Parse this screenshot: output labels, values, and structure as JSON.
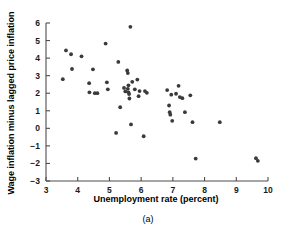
{
  "figure": {
    "panel_label": "(a)",
    "background_color": "#ffffff",
    "marker_color": "#3a3a3a",
    "axis_color": "#4d4d4d"
  },
  "chart_data": {
    "type": "scatter",
    "title": "",
    "subtitle": "",
    "xlabel": "Unemployment rate (percent)",
    "ylabel": "Wage inflation minus lagged price inflation",
    "xlim": [
      3,
      10
    ],
    "ylim": [
      -3,
      6
    ],
    "xticks": [
      3,
      4,
      5,
      6,
      7,
      8,
      9,
      10
    ],
    "yticks": [
      -3,
      -2,
      -1,
      0,
      1,
      2,
      3,
      4,
      5,
      6
    ],
    "xtick_labels": [
      "3",
      "4",
      "5",
      "6",
      "7",
      "8",
      "9",
      "10"
    ],
    "ytick_labels": [
      "−3",
      "−2",
      "−1",
      "0",
      "1",
      "2",
      "3",
      "4",
      "5",
      "6"
    ],
    "grid": false,
    "legend": false,
    "legend_position": "none",
    "annotations": [
      "(a)"
    ],
    "series": [
      {
        "name": "Observations",
        "marker": "circle",
        "color": "#3a3a3a",
        "points": [
          [
            3.53,
            2.8
          ],
          [
            3.63,
            4.44
          ],
          [
            3.79,
            4.22
          ],
          [
            3.82,
            3.38
          ],
          [
            4.12,
            4.1
          ],
          [
            4.36,
            2.57
          ],
          [
            4.37,
            2.05
          ],
          [
            4.48,
            3.36
          ],
          [
            4.54,
            2.0
          ],
          [
            4.62,
            2.0
          ],
          [
            4.88,
            4.83
          ],
          [
            4.92,
            2.62
          ],
          [
            4.95,
            2.22
          ],
          [
            5.21,
            -0.26
          ],
          [
            5.28,
            3.78
          ],
          [
            5.34,
            1.2
          ],
          [
            5.46,
            2.3
          ],
          [
            5.5,
            2.1
          ],
          [
            5.56,
            3.3
          ],
          [
            5.58,
            3.15
          ],
          [
            5.58,
            2.25
          ],
          [
            5.6,
            2.45
          ],
          [
            5.6,
            2.05
          ],
          [
            5.62,
            1.95
          ],
          [
            5.63,
            1.7
          ],
          [
            5.66,
            5.78
          ],
          [
            5.68,
            0.22
          ],
          [
            5.72,
            2.65
          ],
          [
            5.8,
            2.22
          ],
          [
            5.88,
            2.78
          ],
          [
            5.92,
            1.83
          ],
          [
            5.95,
            2.12
          ],
          [
            6.08,
            -0.45
          ],
          [
            6.12,
            2.12
          ],
          [
            6.18,
            2.02
          ],
          [
            6.82,
            2.18
          ],
          [
            6.88,
            1.3
          ],
          [
            6.9,
            0.92
          ],
          [
            6.92,
            0.78
          ],
          [
            6.95,
            1.92
          ],
          [
            6.98,
            0.43
          ],
          [
            7.1,
            1.97
          ],
          [
            7.18,
            2.42
          ],
          [
            7.22,
            1.78
          ],
          [
            7.3,
            1.72
          ],
          [
            7.38,
            0.92
          ],
          [
            7.55,
            1.88
          ],
          [
            7.62,
            0.35
          ],
          [
            7.72,
            -1.72
          ],
          [
            8.48,
            0.35
          ],
          [
            9.62,
            -1.7
          ],
          [
            9.68,
            -1.85
          ]
        ]
      }
    ]
  }
}
